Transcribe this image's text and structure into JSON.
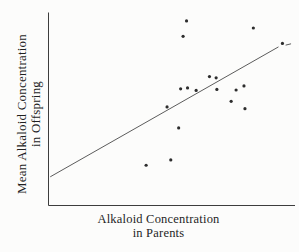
{
  "figure": {
    "background": "#fcfcfb",
    "axis_color": "#3d3d3d",
    "point_color": "#2d2d2d",
    "line_color": "#5c5c5c",
    "text_color": "#1f1f1f"
  },
  "chart_data": {
    "type": "scatter",
    "title": "",
    "xlabel": "Alkaloid Concentration in Parents",
    "ylabel": "Mean Alkaloid Concentration in Offspring",
    "xlabel_lines": [
      "Alkaloid Concentration",
      "in Parents"
    ],
    "ylabel_lines": [
      "Mean Alkaloid Concentration",
      "in Offspring"
    ],
    "x_axis": {
      "min": 0,
      "max": 100,
      "tick_labels": "none"
    },
    "y_axis": {
      "min": 0,
      "max": 100,
      "tick_labels": "none"
    },
    "grid": false,
    "legend": "none",
    "points": [
      {
        "x": 56.0,
        "y": 95.9
      },
      {
        "x": 54.6,
        "y": 87.9
      },
      {
        "x": 83.1,
        "y": 92.2
      },
      {
        "x": 94.9,
        "y": 84.2
      },
      {
        "x": 65.3,
        "y": 67.0
      },
      {
        "x": 68.0,
        "y": 66.3
      },
      {
        "x": 53.6,
        "y": 60.6
      },
      {
        "x": 56.4,
        "y": 61.1
      },
      {
        "x": 59.9,
        "y": 59.8
      },
      {
        "x": 68.3,
        "y": 60.3
      },
      {
        "x": 76.1,
        "y": 60.0
      },
      {
        "x": 79.3,
        "y": 62.1
      },
      {
        "x": 74.1,
        "y": 54.1
      },
      {
        "x": 79.7,
        "y": 50.3
      },
      {
        "x": 48.1,
        "y": 51.2
      },
      {
        "x": 39.6,
        "y": 20.9
      },
      {
        "x": 49.6,
        "y": 23.7
      },
      {
        "x": 52.8,
        "y": 40.3
      }
    ],
    "trendline": {
      "x1": 0.7,
      "y1": 14.9,
      "x2": 93.3,
      "y2": 82.4
    },
    "trendline_dash": {
      "x1": 96.2,
      "y1": 83.3,
      "x2": 98.4,
      "y2": 84.0
    }
  }
}
